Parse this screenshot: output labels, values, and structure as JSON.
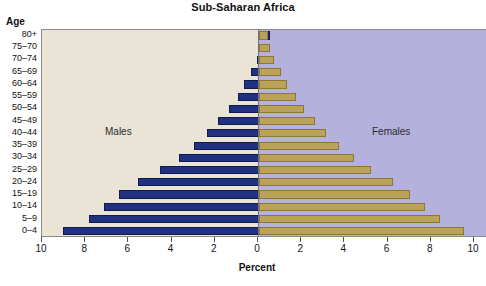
{
  "chart_data": {
    "type": "bar",
    "subtype": "population-pyramid",
    "title": "Sub-Saharan Africa",
    "xlabel": "Percent",
    "ylabel": "Age",
    "xlim": [
      -10,
      10
    ],
    "xtick_labels": [
      "10",
      "8",
      "6",
      "4",
      "2",
      "0",
      "2",
      "4",
      "6",
      "8",
      "10"
    ],
    "xtick_values": [
      -10,
      -8,
      -6,
      -4,
      -2,
      0,
      2,
      4,
      6,
      8,
      10
    ],
    "grid": false,
    "legend": "in-plot",
    "categories": [
      "80+",
      "75–70",
      "70–74",
      "65–69",
      "60–64",
      "55–59",
      "50–54",
      "45–49",
      "40–44",
      "35–39",
      "30–34",
      "25–29",
      "20–24",
      "15–19",
      "10–14",
      "5–9",
      "0–4"
    ],
    "series": [
      {
        "name": "Males",
        "side": "left",
        "color": "#1f3180",
        "values": [
          0.3,
          0.4,
          0.6,
          0.9,
          1.2,
          1.5,
          1.9,
          2.4,
          2.9,
          3.5,
          4.2,
          5.1,
          6.1,
          7.0,
          7.7,
          8.4,
          9.6
        ]
      },
      {
        "name": "Females",
        "side": "right",
        "color": "#bba259",
        "values": [
          0.4,
          0.5,
          0.7,
          1.0,
          1.3,
          1.7,
          2.1,
          2.6,
          3.1,
          3.7,
          4.4,
          5.2,
          6.2,
          7.0,
          7.7,
          8.4,
          9.5
        ]
      }
    ],
    "panel_labels": {
      "left": "Males",
      "right": "Females"
    },
    "colors": {
      "male_bar": "#1f3180",
      "female_bar": "#bba259",
      "male_panel_bg": "#e9e4d5",
      "female_panel_bg": "#b5b1dd",
      "axis_line": "#6f6f86",
      "plot_border": "#8a8a8a"
    }
  }
}
